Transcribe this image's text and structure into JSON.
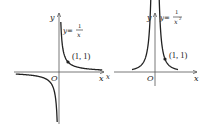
{
  "figures": [
    {
      "id": "reciprocal",
      "function": "y = 1/x",
      "formula": {
        "lhs": "y=",
        "numerator": "1",
        "denominator": "x"
      },
      "axis_labels": {
        "x": "x",
        "y": "y",
        "origin": "O"
      },
      "marked_point": {
        "x": 1,
        "y": 1,
        "label": "(1, 1)"
      },
      "branches": [
        "quadrant-I",
        "quadrant-III"
      ]
    },
    {
      "id": "inverse-square",
      "function": "y = 1/x^2",
      "formula": {
        "lhs": "y=",
        "numerator": "1",
        "denominator": "x",
        "exponent": "2"
      },
      "axis_labels": {
        "x": "x",
        "y": "y",
        "origin": "O",
        "x_left": "x"
      },
      "marked_point": {
        "x": 1,
        "y": 1,
        "label": "(1, 1)"
      },
      "branches": [
        "quadrant-I",
        "quadrant-II"
      ]
    }
  ],
  "colors": {
    "stroke": "#222222",
    "axis": "#444444"
  }
}
